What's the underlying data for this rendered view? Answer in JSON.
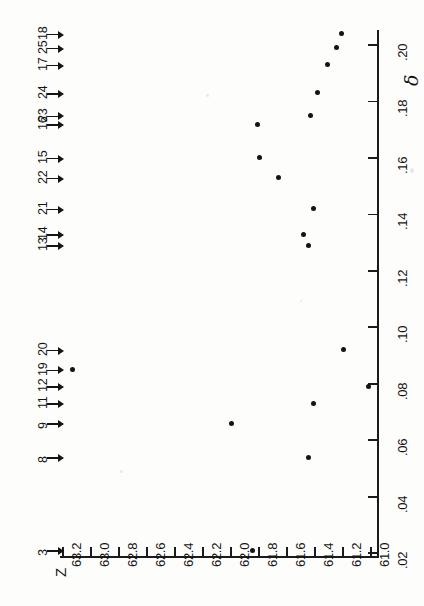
{
  "figure": {
    "orientation": "rotated-90-ccw",
    "background_color": "#fdfdfc",
    "ink_color": "#141414"
  },
  "axes": {
    "delta_axis": {
      "name": "δ",
      "label": "δ",
      "tick_labels": [
        ".02",
        ".04",
        ".06",
        ".08",
        ".10",
        ".12",
        ".14",
        ".16",
        ".18",
        ".20"
      ],
      "range": [
        0.02,
        0.21
      ],
      "orientation": "vertical-right"
    },
    "z_axis": {
      "name": "Z",
      "label": "Z",
      "tick_labels": [
        "63.2",
        "63.0",
        "62.8",
        "62.6",
        "62.4",
        "62.2",
        "62.0",
        "61.8",
        "61.6",
        "61.4",
        "61.2",
        "61.0"
      ],
      "range": [
        61.0,
        63.3
      ],
      "orientation": "horizontal-bottom"
    }
  },
  "arrow_markers": [
    {
      "label": "3",
      "delta": 0.021
    },
    {
      "label": "8",
      "delta": 0.054
    },
    {
      "label": "9",
      "delta": 0.066
    },
    {
      "label": "11",
      "delta": 0.073
    },
    {
      "label": "12",
      "delta": 0.079
    },
    {
      "label": "19",
      "delta": 0.085
    },
    {
      "label": "20",
      "delta": 0.092
    },
    {
      "label": "13",
      "delta": 0.129
    },
    {
      "label": "14",
      "delta": 0.133
    },
    {
      "label": "21",
      "delta": 0.142
    },
    {
      "label": "22",
      "delta": 0.153
    },
    {
      "label": "15",
      "delta": 0.16
    },
    {
      "label": "16",
      "delta": 0.172
    },
    {
      "label": "23",
      "delta": 0.175
    },
    {
      "label": "24",
      "delta": 0.183
    },
    {
      "label": "17",
      "delta": 0.193
    },
    {
      "label": "25",
      "delta": 0.199
    },
    {
      "label": "18",
      "delta": 0.204
    }
  ],
  "chart_data": {
    "type": "scatter",
    "title": "",
    "subtitle": "",
    "xlabel": "δ",
    "ylabel": "Z",
    "xlim": [
      0.02,
      0.21
    ],
    "ylim": [
      61.0,
      63.3
    ],
    "grid": false,
    "legend": null,
    "xtick_labels": [
      ".02",
      ".04",
      ".06",
      ".08",
      ".10",
      ".12",
      ".14",
      ".16",
      ".18",
      ".20"
    ],
    "xticks": [
      0.02,
      0.04,
      0.06,
      0.08,
      0.1,
      0.12,
      0.14,
      0.16,
      0.18,
      0.2
    ],
    "ytick_labels": [
      "61.0",
      "61.2",
      "61.4",
      "61.6",
      "61.8",
      "62.0",
      "62.2",
      "62.4",
      "62.6",
      "62.8",
      "63.0",
      "63.2"
    ],
    "yticks": [
      61.0,
      61.2,
      61.4,
      61.6,
      61.8,
      62.0,
      62.2,
      62.4,
      62.6,
      62.8,
      63.0,
      63.2
    ],
    "series": [
      {
        "name": "observations",
        "marker": "filled-circle",
        "color": "#141414",
        "points": [
          {
            "x": 0.021,
            "y": 61.85
          },
          {
            "x": 0.054,
            "y": 61.45
          },
          {
            "x": 0.066,
            "y": 62.0
          },
          {
            "x": 0.073,
            "y": 61.41
          },
          {
            "x": 0.079,
            "y": 61.02
          },
          {
            "x": 0.085,
            "y": 63.13
          },
          {
            "x": 0.092,
            "y": 61.2
          },
          {
            "x": 0.129,
            "y": 61.45
          },
          {
            "x": 0.133,
            "y": 61.48
          },
          {
            "x": 0.142,
            "y": 61.41
          },
          {
            "x": 0.153,
            "y": 61.66
          },
          {
            "x": 0.16,
            "y": 61.8
          },
          {
            "x": 0.172,
            "y": 61.81
          },
          {
            "x": 0.175,
            "y": 61.43
          },
          {
            "x": 0.183,
            "y": 61.38
          },
          {
            "x": 0.193,
            "y": 61.31
          },
          {
            "x": 0.199,
            "y": 61.25
          },
          {
            "x": 0.204,
            "y": 61.21
          }
        ]
      }
    ],
    "annotations": {
      "arrow_labels": [
        "3",
        "8",
        "9",
        "11",
        "12",
        "19",
        "20",
        "13",
        "14",
        "21",
        "22",
        "15",
        "16",
        "23",
        "24",
        "17",
        "25",
        "18"
      ],
      "note": "Numbered arrows along the upper margin index each δ observation."
    }
  }
}
